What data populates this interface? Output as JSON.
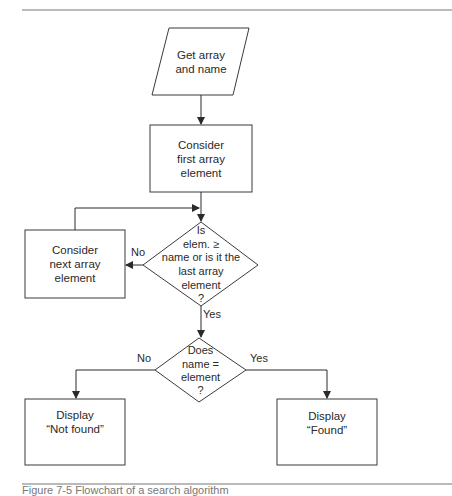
{
  "figure": {
    "type": "flowchart",
    "colors": {
      "stroke": "#3a3a3a",
      "rule": "#777777",
      "text": "#2a2a2a",
      "background": "#ffffff"
    },
    "nodes": {
      "input": {
        "shape": "parallelogram",
        "lines": [
          "Get array",
          "and name"
        ]
      },
      "first": {
        "shape": "process",
        "lines": [
          "Consider",
          "first array",
          "element"
        ]
      },
      "decision1": {
        "shape": "decision",
        "lines": [
          "Is",
          "elem. ≥",
          "name or is it the",
          "last array",
          "element",
          "?"
        ]
      },
      "next": {
        "shape": "process",
        "lines": [
          "Consider",
          "next array",
          "element"
        ]
      },
      "decision2": {
        "shape": "decision",
        "lines": [
          "Does",
          "name =",
          "element",
          "?"
        ]
      },
      "notfound": {
        "shape": "process",
        "lines": [
          "Display",
          "“Not found”"
        ]
      },
      "found": {
        "shape": "process",
        "lines": [
          "Display",
          "“Found”"
        ]
      }
    },
    "edges": {
      "d1_no": "No",
      "d1_yes": "Yes",
      "d2_no": "No",
      "d2_yes": "Yes"
    },
    "caption": "Figure 7-5 Flowchart of a search algorithm"
  }
}
